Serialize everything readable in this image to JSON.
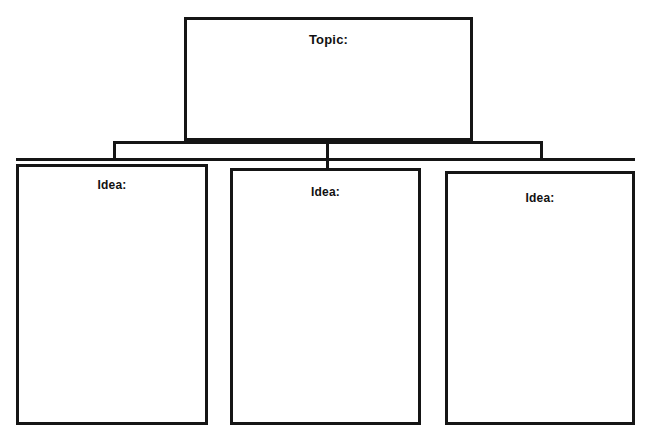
{
  "page": {
    "background_color": "#ffffff",
    "line_color": "#151515",
    "width": 650,
    "height": 441
  },
  "diagram": {
    "type": "concept-map",
    "topic": {
      "label": "Topic:",
      "content": ""
    },
    "ideas": [
      {
        "label": "Idea:",
        "content": ""
      },
      {
        "label": "Idea:",
        "content": ""
      },
      {
        "label": "Idea:",
        "content": ""
      }
    ],
    "connectors": {
      "style": "bracket",
      "description": "Center stem from topic box splits into a horizontal bus with drops into each idea box"
    }
  }
}
